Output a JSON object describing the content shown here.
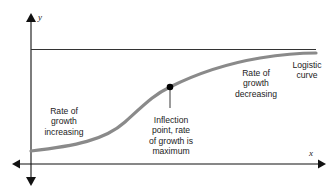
{
  "diagram": {
    "axes": {
      "x_label": "x",
      "y_label": "y"
    },
    "labels": {
      "curve_name": "Logistic\ncurve",
      "growth_increasing": "Rate of\ngrowth\nincreasing",
      "growth_decreasing": "Rate of\ngrowth\ndecreasing",
      "inflection": "Inflection\npoint, rate\nof growth is\nmaximum"
    },
    "colors": {
      "curve": "#8a8a8a",
      "axis": "#111111",
      "asymptote": "#333333",
      "point": "#000000"
    }
  }
}
